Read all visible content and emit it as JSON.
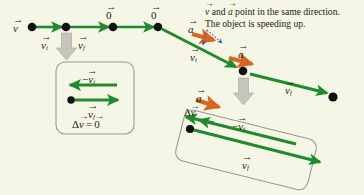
{
  "figure": {
    "background_color": "#f6f6e6",
    "velocity_color": "#1f8a2e",
    "acceleration_color": "#d9661f",
    "gray_arrow_color": "#b8b8ae",
    "annotation_color": "#3b5fa8",
    "box_border_color": "#9a9a8c",
    "dot_color": "#111111",
    "text_color": "#1a1a14"
  },
  "caption": {
    "line1_pre": "v",
    "line1_mid": " and ",
    "line1_a": "a",
    "line1_post": " point in the same direction.",
    "line2": "The object is speeding up."
  },
  "top_track": {
    "name": "constant-velocity-track",
    "labels": {
      "v": "v",
      "zero_1": "0",
      "zero_2": "0",
      "v_i": "v",
      "v_i_sub": "i",
      "v_f": "v",
      "v_f_sub": "f"
    }
  },
  "diagonal_track": {
    "name": "accelerating-track",
    "labels": {
      "a_left": "a",
      "a_right": "a",
      "v_i": "v",
      "v_i_sub": "i",
      "v_f": "v",
      "v_f_sub": "f"
    }
  },
  "left_inset": {
    "name": "zero-delta-v-inset",
    "labels": {
      "minus_v_i_sign": "−",
      "minus_v_i": "v",
      "minus_v_i_sub": "i",
      "v_f": "v",
      "v_f_sub": "f",
      "delta_sign": "Δ",
      "delta_v": "v",
      "equals": "=",
      "zero": "0"
    }
  },
  "right_inset": {
    "name": "nonzero-delta-v-inset",
    "labels": {
      "a": "a",
      "delta_sign": "Δ",
      "delta_v": "v",
      "minus_v_i_sign": "−",
      "minus_v_i": "v",
      "minus_v_i_sub": "i",
      "v_f": "v",
      "v_f_sub": "f"
    }
  }
}
